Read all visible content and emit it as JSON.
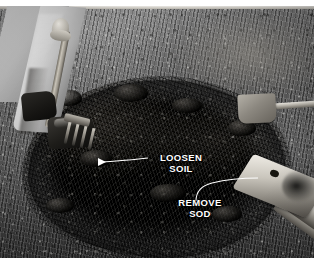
{
  "image": {
    "kind": "instructional-photograph",
    "subject": "Person loosening soil with a garden fork in a circular planting bed with sod removed",
    "palette": {
      "grass": "#6e6a63",
      "soil": "#0e0e0c",
      "trouser": "#d4d0c8",
      "boot": "#1a1917",
      "tool_metal": "#bfbbb2",
      "callout_text": "#ffffff",
      "leader_line": "#ffffff",
      "page_background": "#ffffff"
    },
    "frame": {
      "left": 0,
      "top": 6,
      "width": 314,
      "height": 252
    }
  },
  "callouts": [
    {
      "id": "loosen-soil",
      "label": "LOOSEN\nSOIL",
      "line1": "LOOSEN",
      "line2": "SOIL",
      "arrow": "left-pointing",
      "points_to": "loosened dark soil at center of bed"
    },
    {
      "id": "remove-sod",
      "label": "REMOVE\nSOD",
      "line1": "REMOVE",
      "line2": "SOD",
      "arrow": "curved-no-head",
      "points_to": "spade blade cutting sod at bed edge"
    }
  ],
  "scene_objects": [
    {
      "name": "person-leg",
      "description": "light trousers, lower body only"
    },
    {
      "name": "work-boot",
      "description": "dark leather boot pressing fork"
    },
    {
      "name": "garden-fork",
      "description": "fork with D-grip handle and tines in soil"
    },
    {
      "name": "soil-mound",
      "description": "large oval of dark loosened soil"
    },
    {
      "name": "spade-foreground",
      "description": "spade blade at lower right edge of bed"
    },
    {
      "name": "spade-background",
      "description": "second spade lying on lawn upper right"
    },
    {
      "name": "lawn",
      "description": "surrounding grass turf"
    }
  ]
}
